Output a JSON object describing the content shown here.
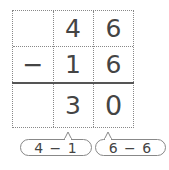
{
  "problem": {
    "operator": "−",
    "top": [
      "",
      "4",
      "6"
    ],
    "middle": [
      "−",
      "1",
      "6"
    ],
    "result": [
      "",
      "3",
      "0"
    ]
  },
  "hints": [
    {
      "label": "4 − 1",
      "column": "tens"
    },
    {
      "label": "6 − 6",
      "column": "ones"
    }
  ]
}
